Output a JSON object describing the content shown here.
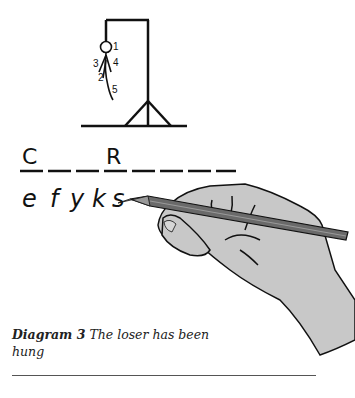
{
  "figure": {
    "gallows": {
      "body_part_labels": [
        "1",
        "2",
        "3",
        "4",
        "5"
      ]
    },
    "word": {
      "slots": 8,
      "revealed": [
        {
          "position": 1,
          "letter": "C"
        },
        {
          "position": 4,
          "letter": "R"
        }
      ]
    },
    "wrong_guesses": [
      "e",
      "f",
      "y",
      "k",
      "s"
    ],
    "colors": {
      "ink": "#111111",
      "hand_fill": "#c8c8c8",
      "pencil": "#6a6a6a"
    }
  },
  "caption": {
    "label": "Diagram 3",
    "text": "The loser has been hung"
  }
}
